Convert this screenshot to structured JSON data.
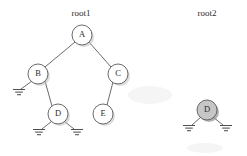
{
  "figure": {
    "type": "binary-tree-diagram",
    "background_color": "#ffffff",
    "stroke_color": "#5a5a5a",
    "shaded_fill": "#c6c6c6",
    "node_fill": "#ffffff"
  },
  "labels": {
    "root1": "root1",
    "root2": "root2"
  },
  "trees": [
    {
      "id": "tree-root1",
      "root_label": "root1",
      "root_label_pos": {
        "x": 81,
        "y": 15
      },
      "nodes": [
        {
          "id": "A",
          "label": "A",
          "cx": 82,
          "cy": 35,
          "r": 10,
          "shaded": false,
          "grounds": []
        },
        {
          "id": "B",
          "label": "B",
          "cx": 38,
          "cy": 74,
          "r": 10,
          "shaded": false,
          "grounds": [
            {
              "x": 19,
              "y": 93
            }
          ]
        },
        {
          "id": "C",
          "label": "C",
          "cx": 118,
          "cy": 74,
          "r": 10,
          "shaded": false,
          "grounds": []
        },
        {
          "id": "D",
          "label": "D",
          "cx": 58,
          "cy": 114,
          "r": 10,
          "shaded": false,
          "grounds": [
            {
              "x": 39,
              "y": 133
            },
            {
              "x": 77,
              "y": 133
            }
          ]
        },
        {
          "id": "E",
          "label": "E",
          "cx": 103,
          "cy": 114,
          "r": 10,
          "shaded": false,
          "grounds": []
        }
      ],
      "edges": [
        {
          "from": "A",
          "to": "B"
        },
        {
          "from": "A",
          "to": "C"
        },
        {
          "from": "B",
          "to": "D"
        },
        {
          "from": "C",
          "to": "E"
        }
      ]
    },
    {
      "id": "tree-root2",
      "root_label": "root2",
      "root_label_pos": {
        "x": 207,
        "y": 15
      },
      "nodes": [
        {
          "id": "D2",
          "label": "D",
          "cx": 207,
          "cy": 110,
          "r": 10,
          "shaded": true,
          "grounds": [
            {
              "x": 189,
              "y": 129
            },
            {
              "x": 226,
              "y": 129
            }
          ]
        }
      ],
      "edges": []
    }
  ],
  "ground_symbol": {
    "name": "ground-symbol",
    "bar_widths": [
      12,
      7.5,
      4
    ],
    "bar_gap": 2.6
  }
}
